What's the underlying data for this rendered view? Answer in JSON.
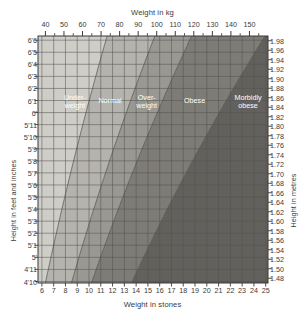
{
  "chart_data": {
    "type": "area",
    "title": "Weight in kg",
    "subtitle": "Weight in stones",
    "xlabel": "Weight in kg",
    "xlabel_bottom": "Weight in stones",
    "ylabel": "Height in feet and inches",
    "ylabel_right": "Height in metres",
    "grid": true,
    "legend_position": "inside-bands",
    "xlim_kg": [
      36,
      160
    ],
    "xlim_stones": [
      5.67,
      25.2
    ],
    "ylim_m": [
      1.47,
      1.99
    ],
    "x_ticks_kg": [
      40,
      50,
      60,
      70,
      80,
      90,
      100,
      110,
      120,
      130,
      140,
      150
    ],
    "x_minor_kg": [
      45,
      55,
      65,
      75,
      85,
      95,
      105,
      115,
      125,
      135,
      145,
      155
    ],
    "x_ticks_stones": [
      6,
      7,
      8,
      9,
      10,
      11,
      12,
      13,
      14,
      15,
      16,
      17,
      18,
      19,
      20,
      21,
      22,
      23,
      24,
      25
    ],
    "y_ticks_feet": [
      "6'6",
      "6'5",
      "6'4",
      "6'3",
      "6'2",
      "6'1",
      "6'",
      "5'11",
      "5'10",
      "5'9",
      "5'8",
      "5'7",
      "5'6",
      "5'5",
      "5'4",
      "5'3",
      "5'2",
      "5'1",
      "5'",
      "4'11",
      "4'10"
    ],
    "y_ticks_metres": [
      "1.98",
      "1.96",
      "1.94",
      "1.92",
      "1.90",
      "1.88",
      "1.86",
      "1.84",
      "1.82",
      "1.80",
      "1.78",
      "1.76",
      "1.74",
      "1.72",
      "1.70",
      "1.68",
      "1.66",
      "1.64",
      "1.62",
      "1.60",
      "1.58",
      "1.56",
      "1.54",
      "1.52",
      "1.50",
      "1.48"
    ],
    "y_metres_values": [
      1.98,
      1.96,
      1.94,
      1.92,
      1.9,
      1.88,
      1.86,
      1.84,
      1.82,
      1.8,
      1.78,
      1.76,
      1.74,
      1.72,
      1.7,
      1.68,
      1.66,
      1.64,
      1.62,
      1.6,
      1.58,
      1.56,
      1.54,
      1.52,
      1.5,
      1.48
    ],
    "y_feet_values_m": [
      1.9812,
      1.9558,
      1.9304,
      1.905,
      1.8796,
      1.8542,
      1.8288,
      1.8034,
      1.778,
      1.7526,
      1.7272,
      1.7018,
      1.6764,
      1.651,
      1.6256,
      1.6002,
      1.5748,
      1.5494,
      1.524,
      1.4986,
      1.4732
    ],
    "bands": [
      {
        "name": "Under-weight",
        "label_lines": [
          "Under-",
          "weight"
        ],
        "bmi_min": 0,
        "bmi_max": 18.5,
        "color": "#cfcdc7"
      },
      {
        "name": "Normal",
        "label_lines": [
          "Normal"
        ],
        "bmi_min": 18.5,
        "bmi_max": 25,
        "color": "#b5b3ad"
      },
      {
        "name": "Over-weight",
        "label_lines": [
          "Over-",
          "weight"
        ],
        "bmi_min": 25,
        "bmi_max": 30,
        "color": "#9a9892"
      },
      {
        "name": "Obese",
        "label_lines": [
          "Obese"
        ],
        "bmi_min": 30,
        "bmi_max": 40,
        "color": "#7e7c77"
      },
      {
        "name": "Morbidly obese",
        "label_lines": [
          "Morbidly",
          "obese"
        ],
        "bmi_min": 40,
        "bmi_max": 100,
        "color": "#63615d"
      }
    ],
    "grid_color": "#55534f",
    "axis_color": "#3a3a3a",
    "band_label_color": "#ffffff"
  }
}
